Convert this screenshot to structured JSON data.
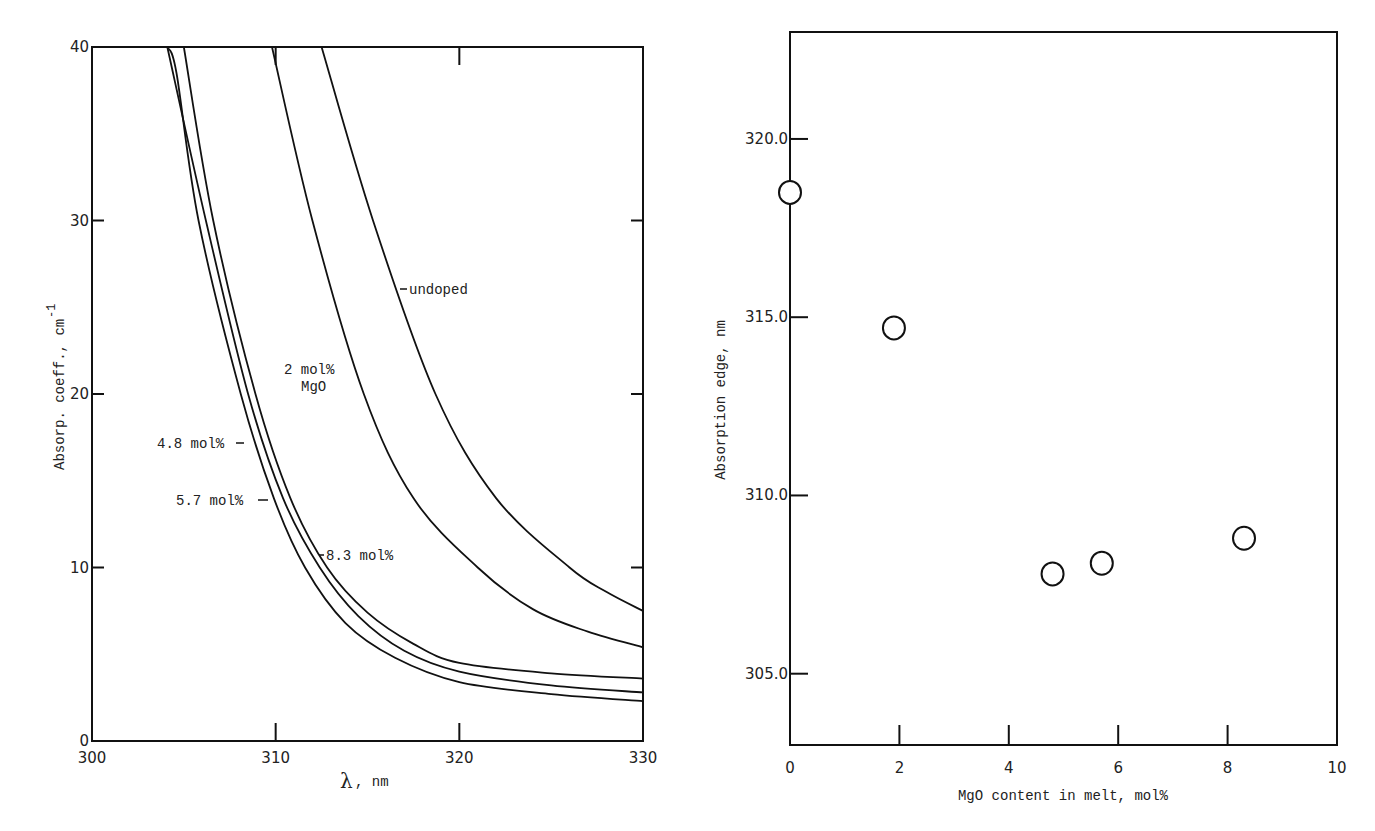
{
  "chart_data": [
    {
      "type": "line",
      "title": "",
      "xlabel": "λ , nm",
      "ylabel": "Absorp. coeff., cm",
      "ylabel_superscript": "-1",
      "xlim": [
        300,
        330
      ],
      "ylim": [
        0,
        40
      ],
      "x_ticks": [
        "300",
        "310",
        "320",
        "330"
      ],
      "y_ticks": [
        "0",
        "10",
        "20",
        "30",
        "40"
      ],
      "grid": false,
      "legend_position": "inline annotations",
      "series": [
        {
          "name": "undoped",
          "label": "undoped",
          "points": [
            [
              312.5,
              40
            ],
            [
              315.3,
              30
            ],
            [
              318.7,
              20
            ],
            [
              322.0,
              14.0
            ],
            [
              326.0,
              10
            ],
            [
              328.0,
              8.6
            ],
            [
              330,
              7.5
            ]
          ]
        },
        {
          "name": "2 mol% MgO",
          "label_line1": "2 mol%",
          "label_line2": "MgO",
          "points": [
            [
              309.8,
              40
            ],
            [
              312.0,
              30
            ],
            [
              314.8,
              20
            ],
            [
              317.5,
              14.0
            ],
            [
              321.0,
              10
            ],
            [
              324.0,
              7.6
            ],
            [
              327.0,
              6.3
            ],
            [
              330,
              5.4
            ]
          ]
        },
        {
          "name": "8.3 mol%",
          "label": "8.3 mol%",
          "points": [
            [
              305.0,
              40
            ],
            [
              306.6,
              30
            ],
            [
              308.9,
              20
            ],
            [
              310.8,
              14.0
            ],
            [
              312.8,
              10
            ],
            [
              315.0,
              7.4
            ],
            [
              317.5,
              5.6
            ],
            [
              320.0,
              4.5
            ],
            [
              325.0,
              3.9
            ],
            [
              330,
              3.6
            ]
          ]
        },
        {
          "name": "5.7 mol%",
          "label": "5.7 mol%",
          "points": [
            [
              304.1,
              40
            ],
            [
              306.2,
              30
            ],
            [
              308.5,
              20
            ],
            [
              310.4,
              14.0
            ],
            [
              312.4,
              10
            ],
            [
              314.5,
              7.2
            ],
            [
              317.0,
              5.2
            ],
            [
              320.0,
              4.0
            ],
            [
              325.0,
              3.2
            ],
            [
              330,
              2.8
            ]
          ]
        },
        {
          "name": "4.8 mol%",
          "label": "4.8 mol%",
          "points": [
            [
              304.1,
              40
            ],
            [
              304.6,
              38.5
            ],
            [
              305.8,
              30
            ],
            [
              308.1,
              20
            ],
            [
              309.9,
              14.0
            ],
            [
              311.6,
              10
            ],
            [
              313.8,
              6.8
            ],
            [
              316.5,
              4.8
            ],
            [
              320.0,
              3.4
            ],
            [
              325.0,
              2.7
            ],
            [
              330,
              2.3
            ]
          ]
        }
      ]
    },
    {
      "type": "scatter",
      "title": "",
      "xlabel": "MgO content in melt, mol%",
      "ylabel": "Absorption edge, nm",
      "xlim": [
        0,
        10
      ],
      "ylim": [
        303.0,
        323.0
      ],
      "x_ticks": [
        "0",
        "2",
        "4",
        "6",
        "8",
        "10"
      ],
      "y_ticks": [
        "305.0",
        "310.0",
        "315.0",
        "320.0"
      ],
      "grid": false,
      "marker": "open circle",
      "x": [
        0,
        1.9,
        4.8,
        5.7,
        8.3
      ],
      "y": [
        318.5,
        314.7,
        307.8,
        308.1,
        308.8
      ]
    }
  ],
  "left": {
    "xlabel_symbol": "λ",
    "xlabel_unit": ", nm",
    "ylabel": "Absorp. coeff., cm",
    "ylabel_sup": "-1",
    "labels": {
      "undoped": "undoped",
      "mgo2_line1": "2 mol%",
      "mgo2_line2": "MgO",
      "mgo48": "4.8 mol%",
      "mgo57": "5.7 mol%",
      "mgo83": "8.3 mol%"
    }
  },
  "right": {
    "xlabel": "MgO content in melt, mol%",
    "ylabel": "Absorption edge, nm"
  }
}
